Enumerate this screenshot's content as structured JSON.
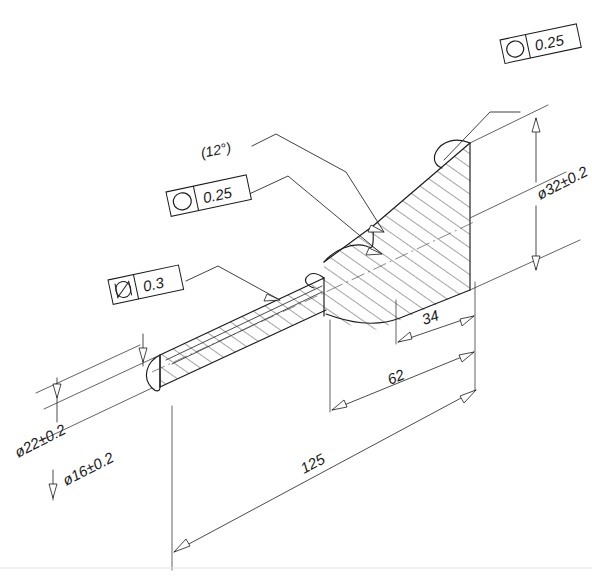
{
  "drawing": {
    "title": "Stepped shaft section view",
    "background_color": "#ffffff",
    "line_color": "#1a1a1a"
  },
  "notes": [
    {
      "id": "taper-angle",
      "label": "(12°)"
    }
  ],
  "feature_control_frames": [
    {
      "id": "fcf-top-right",
      "symbol_name": "circularity-icon",
      "symbol": "circularity",
      "tolerance": "0.25"
    },
    {
      "id": "fcf-middle-left",
      "symbol_name": "circularity-icon",
      "symbol": "circularity",
      "tolerance": "0.25"
    },
    {
      "id": "fcf-lower-left",
      "symbol_name": "cylindricity-icon",
      "symbol": "cylindricity",
      "tolerance": "0.3"
    }
  ],
  "dimensions": [
    {
      "id": "dia-22",
      "label": "ø22±0.2",
      "value": 22,
      "tolerance": "±0.2",
      "type": "diameter"
    },
    {
      "id": "dia-16",
      "label": "ø16±0.2",
      "value": 16,
      "tolerance": "±0.2",
      "type": "diameter"
    },
    {
      "id": "dia-32",
      "label": "ø32±0.2",
      "value": 32,
      "tolerance": "±0.2",
      "type": "diameter"
    },
    {
      "id": "len-34",
      "label": "34",
      "value": 34,
      "tolerance": "",
      "type": "linear"
    },
    {
      "id": "len-62",
      "label": "62",
      "value": 62,
      "tolerance": "",
      "type": "linear"
    },
    {
      "id": "len-125",
      "label": "125",
      "value": 125,
      "tolerance": "",
      "type": "linear"
    }
  ]
}
